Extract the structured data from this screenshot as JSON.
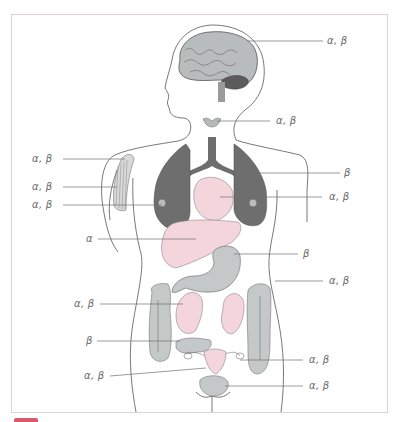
{
  "diagram": {
    "colors": {
      "frame_border": "#e6cfd4",
      "outline": "#555555",
      "leader_line": "#707070",
      "organ_light_gray": "#c4c8c8",
      "organ_dark_gray": "#6e6e6e",
      "organ_pink": "#f5d5dc",
      "label_text": "#6a6a6a",
      "accent_mark": "#d95a6a"
    },
    "labels": [
      {
        "organ": "brain",
        "text": "α, β"
      },
      {
        "organ": "thyroid",
        "text": "α, β"
      },
      {
        "organ": "arm-skin",
        "text": "α, β"
      },
      {
        "organ": "arm-muscle",
        "text": "α, β"
      },
      {
        "organ": "lung-vessel",
        "text": "α, β"
      },
      {
        "organ": "lung",
        "text": "β"
      },
      {
        "organ": "heart",
        "text": "α, β"
      },
      {
        "organ": "liver",
        "text": "α"
      },
      {
        "organ": "stomach",
        "text": "β"
      },
      {
        "organ": "skin-vessels",
        "text": "α, β"
      },
      {
        "organ": "kidney",
        "text": "α, β"
      },
      {
        "organ": "intestine",
        "text": "β"
      },
      {
        "organ": "uterus",
        "text": "α, β"
      },
      {
        "organ": "ovary-tube",
        "text": "α, β"
      },
      {
        "organ": "bladder",
        "text": "α, β"
      }
    ]
  }
}
